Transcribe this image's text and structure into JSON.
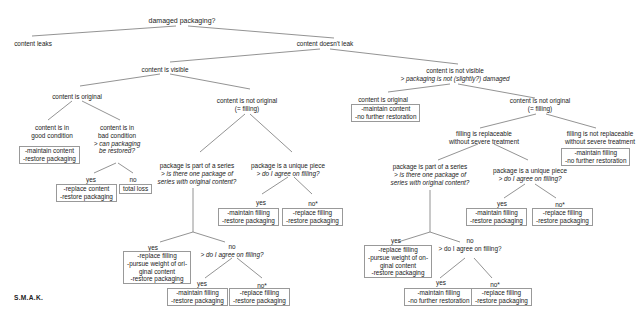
{
  "root": {
    "label": "damaged packaging?"
  },
  "content_leaks": {
    "label": "content leaks"
  },
  "content_doesnt_leak": {
    "label": "content doesn't leak"
  },
  "visible": {
    "label": "content is visible",
    "original": {
      "label": "content is original",
      "good": {
        "lines": [
          "content is in",
          "good condition"
        ],
        "actions": [
          "-maintain content",
          "-restore packaging"
        ]
      },
      "bad": {
        "lines": [
          "content is in",
          "bad condition"
        ],
        "question": [
          "> can packaging",
          "be restored?"
        ],
        "yes": {
          "label": "yes",
          "actions": [
            "-replace content",
            "-restore packaging"
          ]
        },
        "no": {
          "label": "no",
          "actions": [
            "total loss"
          ]
        }
      }
    },
    "not_original": {
      "lines": [
        "content is not original",
        "(= filling)"
      ],
      "series": {
        "label": "package is part of a series",
        "question": [
          "> is there one package of",
          "series with original content?"
        ],
        "yes": {
          "label": "yes",
          "actions": [
            "-replace filling",
            "-pursue weight of ori-",
            "ginal content",
            "-restore packaging"
          ]
        },
        "no": {
          "label": "no",
          "question": "> do I agree on filling?",
          "yes": {
            "label": "yes",
            "actions": [
              "-maintain filling",
              "-restore packaging"
            ]
          },
          "no": {
            "label": "no*",
            "actions": [
              "-replace filling",
              "-restore packaging"
            ]
          }
        }
      },
      "unique": {
        "label": "package is a unique piece",
        "question": "> do I agree on filling?",
        "yes": {
          "label": "yes",
          "actions": [
            "-maintain filling",
            "-restore packaging"
          ]
        },
        "no": {
          "label": "no*",
          "actions": [
            "-replace filling",
            "-restore packaging"
          ]
        }
      }
    }
  },
  "not_visible": {
    "label": "content is not visible",
    "question": "> packaging is not (slightly?) damaged",
    "original": {
      "label": "content is original",
      "actions": [
        "-maintain content",
        "-no further restoration"
      ]
    },
    "not_original": {
      "lines": [
        "content is not original",
        "(= filling)"
      ],
      "replaceable": {
        "lines": [
          "filling is replaceable",
          "without severe treatment"
        ],
        "series": {
          "label": "package is part of a series",
          "question": [
            "> is there one package of",
            "series with original content?"
          ],
          "yes": {
            "label": "yes",
            "actions": [
              "-replace filling",
              "-pursue weight of on-",
              "ginal content",
              "-restore packaging"
            ]
          },
          "no": {
            "label": "no",
            "question": "> do I agree on filling?",
            "yes": {
              "label": "yes",
              "actions": [
                "-maintain filling",
                "-no further restoration"
              ]
            },
            "no": {
              "label": "no*",
              "actions": [
                "-replace filling",
                "-restore packaging"
              ]
            }
          }
        },
        "unique": {
          "label": "package is a unique piece",
          "question": "> do I agree on filling?",
          "yes": {
            "label": "yes",
            "actions": [
              "-maintain filling",
              "-restore packaging"
            ]
          },
          "no": {
            "label": "no*",
            "actions": [
              "-replace filling",
              "-restore packaging"
            ]
          }
        }
      },
      "not_replaceable": {
        "lines": [
          "filling is not replaceable",
          "without severe treatment"
        ],
        "actions": [
          "-maintain filling",
          "-no further restoration"
        ]
      }
    }
  },
  "brand": "S.M.A.K."
}
